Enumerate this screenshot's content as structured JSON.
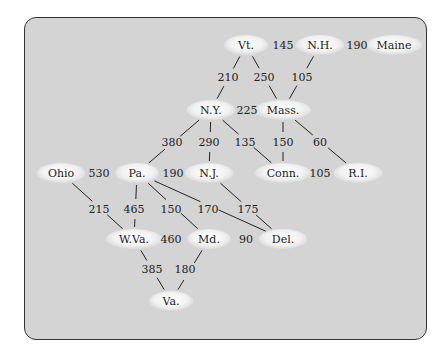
{
  "diagram": {
    "type": "weighted-graph",
    "title": "",
    "nodes": [
      {
        "id": "vt",
        "label": "Vt.",
        "x": 246,
        "y": 45
      },
      {
        "id": "nh",
        "label": "N.H.",
        "x": 320,
        "y": 45
      },
      {
        "id": "maine",
        "label": "Maine",
        "x": 394,
        "y": 45
      },
      {
        "id": "ny",
        "label": "N.Y.",
        "x": 211,
        "y": 110
      },
      {
        "id": "mass",
        "label": "Mass.",
        "x": 283,
        "y": 110
      },
      {
        "id": "ohio",
        "label": "Ohio",
        "x": 61,
        "y": 173
      },
      {
        "id": "pa",
        "label": "Pa.",
        "x": 137,
        "y": 173
      },
      {
        "id": "nj",
        "label": "N.J.",
        "x": 209,
        "y": 173
      },
      {
        "id": "conn",
        "label": "Conn.",
        "x": 283,
        "y": 173
      },
      {
        "id": "ri",
        "label": "R.I.",
        "x": 358,
        "y": 173
      },
      {
        "id": "wva",
        "label": "W.Va.",
        "x": 134,
        "y": 239
      },
      {
        "id": "md",
        "label": "Md.",
        "x": 209,
        "y": 239
      },
      {
        "id": "del",
        "label": "Del.",
        "x": 283,
        "y": 239
      },
      {
        "id": "va",
        "label": "Va.",
        "x": 171,
        "y": 301
      }
    ],
    "edges": [
      {
        "from": "vt",
        "to": "nh",
        "weight": "145",
        "lx": 283,
        "ly": 49,
        "orient": "h"
      },
      {
        "from": "nh",
        "to": "maine",
        "weight": "190",
        "lx": 357,
        "ly": 49,
        "orient": "h"
      },
      {
        "from": "vt",
        "to": "ny",
        "weight": "210",
        "lx": 228,
        "ly": 81
      },
      {
        "from": "vt",
        "to": "mass",
        "weight": "250",
        "lx": 264,
        "ly": 81
      },
      {
        "from": "nh",
        "to": "mass",
        "weight": "105",
        "lx": 302,
        "ly": 81
      },
      {
        "from": "ny",
        "to": "mass",
        "weight": "225",
        "lx": 247,
        "ly": 114,
        "orient": "h"
      },
      {
        "from": "ny",
        "to": "pa",
        "weight": "380",
        "lx": 172,
        "ly": 146
      },
      {
        "from": "ny",
        "to": "nj",
        "weight": "290",
        "lx": 209,
        "ly": 146
      },
      {
        "from": "ny",
        "to": "conn",
        "weight": "135",
        "lx": 245,
        "ly": 146
      },
      {
        "from": "mass",
        "to": "conn",
        "weight": "150",
        "lx": 283,
        "ly": 146
      },
      {
        "from": "mass",
        "to": "ri",
        "weight": "60",
        "lx": 320,
        "ly": 146
      },
      {
        "from": "ohio",
        "to": "pa",
        "weight": "530",
        "lx": 99,
        "ly": 177,
        "orient": "h"
      },
      {
        "from": "pa",
        "to": "nj",
        "weight": "190",
        "lx": 173,
        "ly": 177,
        "orient": "h"
      },
      {
        "from": "conn",
        "to": "ri",
        "weight": "105",
        "lx": 320,
        "ly": 177,
        "orient": "h"
      },
      {
        "from": "ohio",
        "to": "wva",
        "weight": "215",
        "lx": 99,
        "ly": 213
      },
      {
        "from": "pa",
        "to": "wva",
        "weight": "465",
        "lx": 134,
        "ly": 213
      },
      {
        "from": "pa",
        "to": "md",
        "weight": "150",
        "lx": 171,
        "ly": 213
      },
      {
        "from": "pa",
        "to": "del",
        "weight": "170",
        "lx": 208,
        "ly": 213
      },
      {
        "from": "nj",
        "to": "del",
        "weight": "175",
        "lx": 248,
        "ly": 213
      },
      {
        "from": "wva",
        "to": "md",
        "weight": "460",
        "lx": 171,
        "ly": 243,
        "orient": "h"
      },
      {
        "from": "md",
        "to": "del",
        "weight": "90",
        "lx": 246,
        "ly": 243,
        "orient": "h"
      },
      {
        "from": "wva",
        "to": "va",
        "weight": "385",
        "lx": 152,
        "ly": 273
      },
      {
        "from": "md",
        "to": "va",
        "weight": "180",
        "lx": 185,
        "ly": 273
      }
    ]
  },
  "colors": {
    "panel_bg": "#d4d4d4",
    "panel_border": "#333333",
    "node_fill": "#f4f4f4",
    "text": "#222222"
  }
}
